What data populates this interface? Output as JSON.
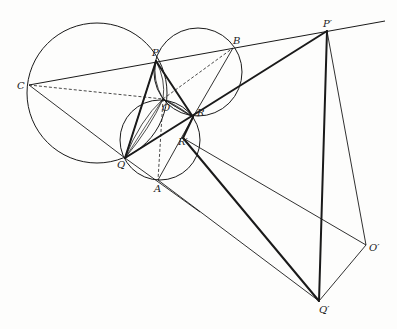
{
  "diagram": {
    "type": "geometry-construction",
    "stroke_color": "#1a1a1a",
    "points": {
      "P": {
        "label": "P",
        "x": 156,
        "y": 61,
        "lx": 152,
        "ly": 48
      },
      "B": {
        "label": "B",
        "x": 233,
        "y": 48,
        "lx": 233,
        "ly": 36
      },
      "Pp": {
        "label": "P′",
        "x": 327,
        "y": 31,
        "lx": 323,
        "ly": 19
      },
      "C": {
        "label": "C",
        "x": 29,
        "y": 85,
        "lx": 17,
        "ly": 81
      },
      "O": {
        "label": "O",
        "x": 163,
        "y": 99,
        "lx": 162,
        "ly": 103
      },
      "R": {
        "label": "R",
        "x": 193,
        "y": 117,
        "lx": 197,
        "ly": 108
      },
      "Rp": {
        "label": "R′",
        "x": 183,
        "y": 138,
        "lx": 178,
        "ly": 137
      },
      "Q": {
        "label": "Q",
        "x": 125,
        "y": 158,
        "lx": 117,
        "ly": 160
      },
      "A": {
        "label": "A",
        "x": 158,
        "y": 180,
        "lx": 154,
        "ly": 184
      },
      "Op": {
        "label": "O′",
        "x": 366,
        "y": 245,
        "lx": 369,
        "ly": 243
      },
      "Qp": {
        "label": "Q′",
        "x": 319,
        "y": 301,
        "lx": 319,
        "ly": 305
      }
    },
    "circles": [
      {
        "name": "circle-CPQ",
        "cx": 97,
        "cy": 93,
        "r": 70
      },
      {
        "name": "circle-PBR",
        "cx": 198,
        "cy": 72,
        "r": 44
      },
      {
        "name": "circle-QAR",
        "cx": 160,
        "cy": 140,
        "r": 40
      }
    ]
  }
}
